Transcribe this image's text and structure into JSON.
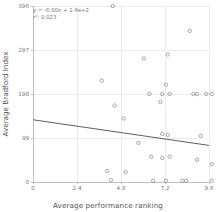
{
  "chart_data": {
    "type": "scatter",
    "title": "",
    "xlabel": "Average performance ranking",
    "ylabel": "Average Bradford Index",
    "xlim": [
      0,
      9.6
    ],
    "ylim": [
      0,
      396
    ],
    "xticks": [
      "0",
      "2.4",
      "4.8",
      "7.2",
      "9.6"
    ],
    "xtick_values": [
      0,
      2.4,
      4.8,
      7.2,
      9.6
    ],
    "yticks": [
      "0",
      "99",
      "198",
      "297",
      "396"
    ],
    "ytick_values": [
      0,
      99,
      198,
      297,
      396
    ],
    "grid": true,
    "legend": "none",
    "marker": "open-circle",
    "marker_color": "#8c8c8c",
    "line_color": "#4d4d4d",
    "grid_color": "#e3e3e3",
    "annotations": {
      "equation": "y = -6.00x + 1.4e+2",
      "r_squared": "r²: 0.023"
    },
    "fit_line": {
      "slope": -6.0,
      "intercept": 140,
      "x_start": 0,
      "x_end": 9.6,
      "y_start": 140,
      "y_end": 82.4
    },
    "points": [
      {
        "x": 4.35,
        "y": 396
      },
      {
        "x": 8.55,
        "y": 340
      },
      {
        "x": 7.35,
        "y": 287
      },
      {
        "x": 6.05,
        "y": 278
      },
      {
        "x": 3.75,
        "y": 228
      },
      {
        "x": 7.25,
        "y": 219
      },
      {
        "x": 6.35,
        "y": 198
      },
      {
        "x": 7.05,
        "y": 198
      },
      {
        "x": 7.45,
        "y": 198
      },
      {
        "x": 8.75,
        "y": 198
      },
      {
        "x": 8.95,
        "y": 198
      },
      {
        "x": 9.45,
        "y": 198
      },
      {
        "x": 9.75,
        "y": 198
      },
      {
        "x": 6.95,
        "y": 180
      },
      {
        "x": 4.45,
        "y": 172
      },
      {
        "x": 4.95,
        "y": 143
      },
      {
        "x": 7.05,
        "y": 108
      },
      {
        "x": 7.35,
        "y": 106
      },
      {
        "x": 9.15,
        "y": 104
      },
      {
        "x": 5.75,
        "y": 88
      },
      {
        "x": 6.45,
        "y": 57
      },
      {
        "x": 7.05,
        "y": 54
      },
      {
        "x": 7.45,
        "y": 57
      },
      {
        "x": 8.95,
        "y": 50
      },
      {
        "x": 9.75,
        "y": 40
      },
      {
        "x": 4.05,
        "y": 25
      },
      {
        "x": 5.05,
        "y": 22
      },
      {
        "x": 4.25,
        "y": 4
      },
      {
        "x": 6.55,
        "y": 3
      },
      {
        "x": 7.25,
        "y": 3
      },
      {
        "x": 8.15,
        "y": 3
      },
      {
        "x": 8.35,
        "y": 3
      },
      {
        "x": 9.75,
        "y": 3
      }
    ]
  }
}
